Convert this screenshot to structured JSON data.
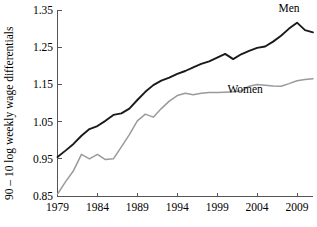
{
  "chart_data": {
    "type": "line",
    "title": "",
    "xlabel": "",
    "ylabel": "90 – 10 log weekly wage differentials",
    "xlim": [
      1979,
      2011
    ],
    "ylim": [
      0.85,
      1.35
    ],
    "grid": false,
    "legend_position": "inline-annotation",
    "xticks": [
      1979,
      1984,
      1989,
      1994,
      1999,
      2004,
      2009
    ],
    "xtick_labels": [
      "1979",
      "1984",
      "1989",
      "1994",
      "1999",
      "2004",
      "2009"
    ],
    "yticks": [
      0.85,
      0.95,
      1.05,
      1.15,
      1.25,
      1.35
    ],
    "ytick_labels": [
      "0.85",
      "0.95",
      "1.05",
      "1.15",
      "1.25",
      "1.35"
    ],
    "x": [
      1979,
      1980,
      1981,
      1982,
      1983,
      1984,
      1985,
      1986,
      1987,
      1988,
      1989,
      1990,
      1991,
      1992,
      1993,
      1994,
      1995,
      1996,
      1997,
      1998,
      1999,
      2000,
      2001,
      2002,
      2003,
      2004,
      2005,
      2006,
      2007,
      2008,
      2009,
      2010,
      2011
    ],
    "series": [
      {
        "name": "Men",
        "color": "#1a1a1a",
        "width": 1.9,
        "label": "Men",
        "label_x": 2008.0,
        "label_y": 1.345,
        "values": [
          0.955,
          0.972,
          0.99,
          1.012,
          1.03,
          1.038,
          1.052,
          1.068,
          1.072,
          1.085,
          1.108,
          1.13,
          1.148,
          1.16,
          1.168,
          1.178,
          1.186,
          1.196,
          1.205,
          1.212,
          1.222,
          1.232,
          1.218,
          1.231,
          1.24,
          1.248,
          1.252,
          1.265,
          1.281,
          1.3,
          1.316,
          1.296,
          1.29
        ]
      },
      {
        "name": "Women",
        "color": "#9a9a9a",
        "width": 1.5,
        "label": "Women",
        "label_x": 2002.5,
        "label_y": 1.128,
        "values": [
          0.855,
          0.888,
          0.918,
          0.962,
          0.95,
          0.962,
          0.948,
          0.95,
          0.982,
          1.015,
          1.052,
          1.07,
          1.062,
          1.085,
          1.105,
          1.12,
          1.126,
          1.122,
          1.126,
          1.128,
          1.128,
          1.129,
          1.13,
          1.132,
          1.145,
          1.15,
          1.148,
          1.146,
          1.145,
          1.152,
          1.16,
          1.163,
          1.165
        ]
      }
    ]
  },
  "axis": {
    "y_title": "90 – 10 log weekly wage differentials"
  }
}
